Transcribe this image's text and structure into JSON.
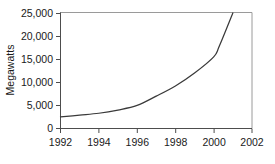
{
  "chart_data": {
    "type": "line",
    "title": "",
    "xlabel": "",
    "ylabel": "Megawatts",
    "xlim": [
      1992,
      2002
    ],
    "ylim": [
      0,
      25000
    ],
    "grid": false,
    "legend": false,
    "x_ticks": [
      "1992",
      "1994",
      "1996",
      "1998",
      "2000",
      "2002"
    ],
    "x_tick_values": [
      1992,
      1994,
      1996,
      1998,
      2000,
      2002
    ],
    "y_ticks": [
      "0",
      "5,000",
      "10,000",
      "15,000",
      "20,000",
      "25,000"
    ],
    "y_tick_values": [
      0,
      5000,
      10000,
      15000,
      20000,
      25000
    ],
    "series": [
      {
        "name": "Megawatts",
        "color": "#3a3a3a",
        "x": [
          1992,
          1993,
          1994,
          1995,
          1996,
          1997,
          1998,
          1999,
          2000,
          2000.3,
          2001.0
        ],
        "values": [
          2500,
          2900,
          3300,
          4000,
          5000,
          7000,
          9200,
          12000,
          15500,
          17900,
          25000
        ]
      }
    ]
  },
  "labels": {
    "y_axis_title": "Megawatts",
    "y0": "0",
    "y1": "5,000",
    "y2": "10,000",
    "y3": "15,000",
    "y4": "20,000",
    "y5": "25,000",
    "x0": "1992",
    "x1": "1994",
    "x2": "1996",
    "x3": "1998",
    "x4": "2000",
    "x5": "2002"
  },
  "colors": {
    "line": "#3a3a3a",
    "axis": "#4d4d4d",
    "border": "#9a9a9a",
    "text": "#1a1a1a",
    "background": "#ffffff"
  }
}
